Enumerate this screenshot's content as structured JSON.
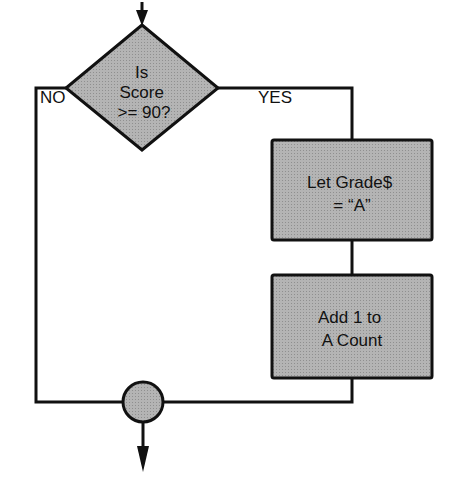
{
  "flowchart": {
    "decision": {
      "lines": [
        "Is",
        "Score",
        ">=  90?"
      ]
    },
    "branch_no_label": "NO",
    "branch_yes_label": "YES",
    "process_1": {
      "lines": [
        "Let Grade$",
        "=  “A”"
      ]
    },
    "process_2": {
      "lines": [
        "Add 1 to",
        "A Count"
      ]
    }
  },
  "colors": {
    "fill": "#a9a9a9",
    "stroke": "#111111",
    "background": "#ffffff"
  }
}
